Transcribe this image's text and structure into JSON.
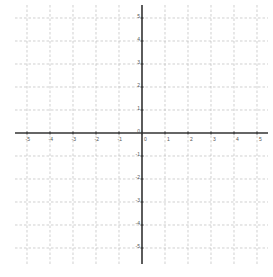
{
  "chart_data": {
    "type": "scatter",
    "title": "",
    "xlabel": "",
    "ylabel": "",
    "xlim": [
      -5.5,
      5.5
    ],
    "ylim": [
      -5.6,
      5.5
    ],
    "grid": true,
    "grid_style": "dashed",
    "x_ticks": [
      -5,
      -4,
      -3,
      -2,
      -1,
      0,
      1,
      2,
      3,
      4,
      5
    ],
    "y_ticks": [
      -5,
      -4,
      -3,
      -2,
      -1,
      0,
      1,
      2,
      3,
      4,
      5
    ],
    "x_tick_labels": [
      "-5",
      "-4",
      "-3",
      "-2",
      "-1",
      "0",
      "1",
      "2",
      "3",
      "4",
      "5"
    ],
    "y_tick_labels": [
      "-5",
      "-4",
      "-3",
      "-2",
      "-1",
      "0",
      "1",
      "2",
      "3",
      "4",
      "5"
    ],
    "series": []
  },
  "layout": {
    "origin_px": [
      142,
      133
    ],
    "unit_px": 23,
    "x_axis_px": [
      15,
      268
    ],
    "y_axis_px": [
      5,
      264
    ],
    "colors": {
      "axis": "#333333",
      "grid": "#bbbbbb",
      "label": "#555555",
      "background": "#ffffff"
    }
  }
}
